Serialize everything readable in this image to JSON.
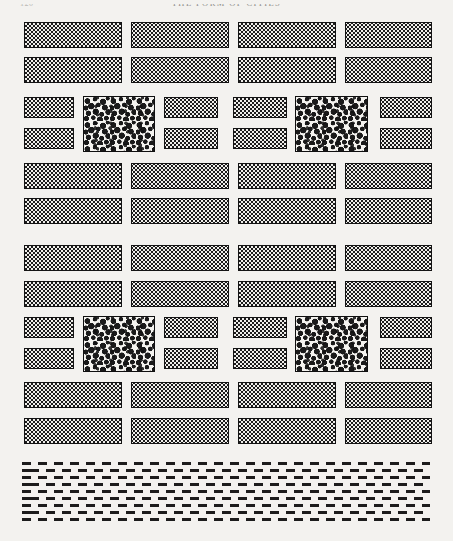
{
  "page": {
    "folio": "120",
    "running_head": "THE FORM OF CITIES",
    "figure_type": "idealized city plan",
    "background_color": "#f3f2ef",
    "ink_color": "#141414"
  },
  "legend": {
    "built_block_label": "built city block",
    "park_block_label": "park / tree canopy block",
    "water_label": "water body"
  },
  "plan": {
    "columns_wide": [
      {
        "name": "col-1",
        "x": 24,
        "w": 98
      },
      {
        "name": "col-2",
        "x": 131,
        "w": 98
      },
      {
        "name": "col-3",
        "x": 238,
        "w": 98
      },
      {
        "name": "col-4",
        "x": 345,
        "w": 87
      }
    ],
    "columns_narrow": [
      {
        "name": "n-col-1",
        "x": 24,
        "w": 50
      },
      {
        "name": "n-col-2",
        "x": 164,
        "w": 54
      },
      {
        "name": "n-col-3",
        "x": 233,
        "w": 54
      },
      {
        "name": "n-col-4",
        "x": 380,
        "w": 52
      }
    ],
    "rows_wide": [
      {
        "name": "row-1",
        "y": 22,
        "h": 26
      },
      {
        "name": "row-2",
        "y": 57,
        "h": 26
      },
      {
        "name": "row-3",
        "y": 163,
        "h": 26
      },
      {
        "name": "row-4",
        "y": 198,
        "h": 26
      },
      {
        "name": "row-5",
        "y": 245,
        "h": 26
      },
      {
        "name": "row-6",
        "y": 281,
        "h": 26
      },
      {
        "name": "row-7",
        "y": 382,
        "h": 26
      },
      {
        "name": "row-8",
        "y": 418,
        "h": 26
      }
    ],
    "rows_narrow": [
      {
        "name": "n-row-1",
        "y": 97,
        "h": 21
      },
      {
        "name": "n-row-2",
        "y": 128,
        "h": 21
      },
      {
        "name": "n-row-3",
        "y": 317,
        "h": 21
      },
      {
        "name": "n-row-4",
        "y": 348,
        "h": 21
      }
    ],
    "parks": [
      {
        "name": "park-upper-left",
        "x": 83,
        "y": 96,
        "w": 72,
        "h": 56
      },
      {
        "name": "park-upper-right",
        "x": 295,
        "y": 96,
        "w": 73,
        "h": 56
      },
      {
        "name": "park-lower-left",
        "x": 83,
        "y": 316,
        "w": 72,
        "h": 56
      },
      {
        "name": "park-lower-right",
        "x": 295,
        "y": 316,
        "w": 73,
        "h": 56
      }
    ],
    "water": {
      "name": "river",
      "x": 22,
      "y": 462,
      "w": 408,
      "h": 58,
      "rows": 9
    }
  }
}
